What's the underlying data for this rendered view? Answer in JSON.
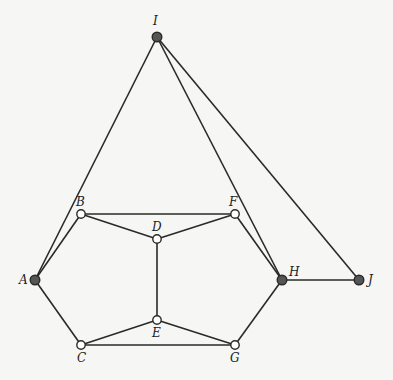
{
  "diagram": {
    "type": "graph",
    "colors": {
      "background": "#f6f6f4",
      "edge": "#2a2a2a",
      "filled_node": "#555555",
      "hollow_node_fill": "#ffffff",
      "node_stroke": "#2a2a2a"
    },
    "nodes": [
      {
        "id": "I",
        "label": "I",
        "x": 157,
        "y": 37,
        "style": "filled",
        "lx": 153,
        "ly": 25
      },
      {
        "id": "A",
        "label": "A",
        "x": 35,
        "y": 280,
        "style": "filled",
        "lx": 19,
        "ly": 284
      },
      {
        "id": "B",
        "label": "B",
        "x": 81,
        "y": 214,
        "style": "hollow",
        "lx": 76,
        "ly": 206
      },
      {
        "id": "F",
        "label": "F",
        "x": 235,
        "y": 214,
        "style": "hollow",
        "lx": 229,
        "ly": 206
      },
      {
        "id": "D",
        "label": "D",
        "x": 157,
        "y": 239,
        "style": "hollow",
        "lx": 152,
        "ly": 231
      },
      {
        "id": "H",
        "label": "H",
        "x": 282,
        "y": 280,
        "style": "filled",
        "lx": 289,
        "ly": 276
      },
      {
        "id": "J",
        "label": "J",
        "x": 359,
        "y": 280,
        "style": "filled",
        "lx": 368,
        "ly": 284
      },
      {
        "id": "C",
        "label": "C",
        "x": 81,
        "y": 345,
        "style": "hollow",
        "lx": 77,
        "ly": 362
      },
      {
        "id": "E",
        "label": "E",
        "x": 157,
        "y": 320,
        "style": "hollow",
        "lx": 152,
        "ly": 337
      },
      {
        "id": "G",
        "label": "G",
        "x": 235,
        "y": 345,
        "style": "hollow",
        "lx": 230,
        "ly": 362
      }
    ],
    "edges": [
      [
        "I",
        "A"
      ],
      [
        "I",
        "H"
      ],
      [
        "I",
        "J"
      ],
      [
        "A",
        "B"
      ],
      [
        "A",
        "C"
      ],
      [
        "B",
        "F"
      ],
      [
        "B",
        "D"
      ],
      [
        "F",
        "D"
      ],
      [
        "F",
        "H"
      ],
      [
        "D",
        "E"
      ],
      [
        "H",
        "G"
      ],
      [
        "H",
        "J"
      ],
      [
        "C",
        "E"
      ],
      [
        "C",
        "G"
      ],
      [
        "E",
        "G"
      ]
    ]
  }
}
